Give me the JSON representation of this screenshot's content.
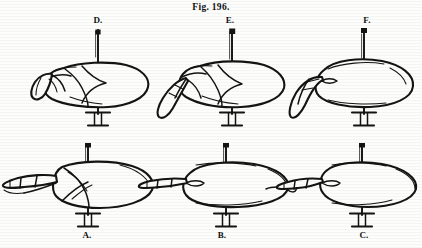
{
  "plate": {
    "title": "Fig. 196.",
    "background_color": "#fdfdfc",
    "ink_color": "#141414",
    "width": 422,
    "height": 248
  },
  "panels": [
    {
      "id": "D",
      "label": "D.",
      "row": "top",
      "column": 1,
      "subject": "pinned-specimen-lateral-view",
      "description": "Specimen body in lateral view with layered wing case and short appendage, mounted on a vertical pin with a flared foot.",
      "mount": "pin-with-base"
    },
    {
      "id": "E",
      "label": "E.",
      "row": "top",
      "column": 2,
      "subject": "pinned-specimen-lateral-view",
      "description": "Specimen in lateral view with an elongated downward-curving appendage extending from the head end, mounted on a vertical pin with a flared foot.",
      "mount": "pin-with-base"
    },
    {
      "id": "F",
      "label": "F.",
      "row": "top",
      "column": 3,
      "subject": "pinned-specimen-lateral-view",
      "description": "Smooth specimen in lateral view with a free hook-shaped appendage curving downward and forward, mounted on a vertical pin with a flared foot.",
      "mount": "pin-with-base"
    },
    {
      "id": "A",
      "label": "A.",
      "row": "bottom",
      "column": 1,
      "subject": "pinned-specimen-ventral-view",
      "description": "Specimen in ventral view, broad rounded body with a forked pair of segmented appendages projecting to the left, mounted on a vertical pin with a flared foot.",
      "mount": "pin-with-base"
    },
    {
      "id": "B",
      "label": "B.",
      "row": "bottom",
      "column": 2,
      "subject": "pinned-specimen-ventral-view",
      "description": "Specimen in ventral view with a straight segmented appendage projecting to the left, mounted on a vertical pin with a flared foot.",
      "mount": "pin-with-base"
    },
    {
      "id": "C",
      "label": "C.",
      "row": "bottom",
      "column": 3,
      "subject": "pinned-specimen-ventral-view",
      "description": "Narrow tapered specimen in ventral view with a long tapering appendage projecting to the left, mounted on a vertical pin with a flared foot.",
      "mount": "pin-with-base"
    }
  ]
}
